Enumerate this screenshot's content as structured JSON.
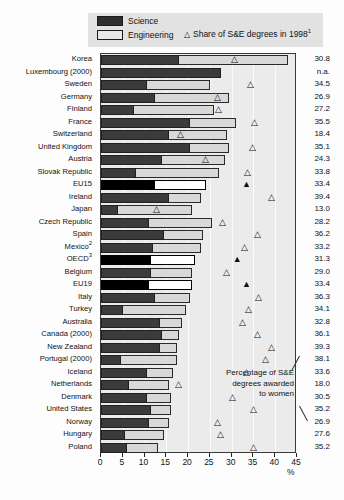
{
  "legend": {
    "science_label": "Science",
    "engineering_label": "Engineering",
    "triangle_glyph": "△",
    "share_label": "Share of S&E degrees in 1998",
    "share_footnote": "1"
  },
  "annotation": {
    "line1": "Percentage of S&E",
    "line2": "degrees awarded",
    "line3": "to women"
  },
  "axis": {
    "ticks": [
      "0",
      "5",
      "10",
      "15",
      "20",
      "25",
      "30",
      "35",
      "40",
      "45"
    ],
    "unit": "%",
    "min": 0,
    "max": 45
  },
  "colors": {
    "science": "#3b3b3b",
    "engineering": "#d8d8d8",
    "highlight": "#000000",
    "plot_bg": "#ebebeb",
    "legend_bg": "#e2e2e2"
  },
  "chart_data": {
    "type": "bar",
    "orientation": "horizontal",
    "stacked": true,
    "title": "",
    "xlabel": "%",
    "ylabel": "",
    "xlim": [
      0,
      45
    ],
    "grid": true,
    "legend_position": "top",
    "categories": [
      "Korea",
      "Luxembourg (2000)",
      "Sweden",
      "Germany",
      "Finland",
      "France",
      "Switzerland",
      "United Kingdom",
      "Austria",
      "Slovak Republic",
      "EU15",
      "Ireland",
      "Japan",
      "Czech Republic",
      "Spain",
      "Mexico",
      "OECD",
      "Belgium",
      "EU19",
      "Italy",
      "Turkey",
      "Australia",
      "Canada (2000)",
      "New Zealand",
      "Portugal (2000)",
      "Iceland",
      "Netherlands",
      "Denmark",
      "United States",
      "Norway",
      "Hungary",
      "Poland"
    ],
    "category_footnotes": {
      "Mexico": "2",
      "OECD": "3"
    },
    "series": [
      {
        "name": "Science",
        "values": [
          18.0,
          27.5,
          10.5,
          12.5,
          7.5,
          20.5,
          15.5,
          20.5,
          14.0,
          8.0,
          12.5,
          15.5,
          4.0,
          11.0,
          14.5,
          12.0,
          11.5,
          11.5,
          11.0,
          12.5,
          5.0,
          13.5,
          14.0,
          13.5,
          4.5,
          10.5,
          6.5,
          10.5,
          11.5,
          11.0,
          5.5,
          6.0
        ]
      },
      {
        "name": "Engineering",
        "values": [
          25.0,
          0.0,
          14.5,
          17.0,
          18.5,
          10.5,
          13.5,
          9.0,
          14.5,
          19.0,
          11.5,
          7.5,
          17.0,
          14.5,
          9.0,
          11.0,
          10.0,
          9.5,
          10.0,
          8.0,
          14.5,
          5.0,
          4.0,
          4.0,
          13.0,
          6.0,
          9.0,
          5.5,
          4.5,
          4.5,
          9.0,
          7.0
        ]
      }
    ],
    "totals": [
      43.0,
      27.5,
      25.0,
      29.5,
      26.0,
      31.0,
      29.0,
      29.5,
      28.5,
      27.0,
      24.0,
      23.0,
      21.0,
      25.5,
      23.5,
      23.0,
      21.5,
      21.0,
      21.0,
      20.5,
      19.5,
      18.5,
      18.0,
      17.5,
      17.5,
      16.5,
      15.5,
      16.0,
      16.0,
      15.5,
      14.5,
      13.0
    ],
    "share_of_se_degrees_1998": [
      {
        "category": "Korea",
        "value": 30.8,
        "marker": "open"
      },
      {
        "category": "Luxembourg (2000)",
        "value": null,
        "label": "n.a.",
        "marker": "none"
      },
      {
        "category": "Sweden",
        "value": 34.5,
        "marker": "open"
      },
      {
        "category": "Germany",
        "value": 26.9,
        "marker": "open"
      },
      {
        "category": "Finland",
        "value": 27.2,
        "marker": "open"
      },
      {
        "category": "France",
        "value": 35.5,
        "marker": "open"
      },
      {
        "category": "Switzerland",
        "value": 18.4,
        "marker": "open"
      },
      {
        "category": "United Kingdom",
        "value": 35.1,
        "marker": "open"
      },
      {
        "category": "Austria",
        "value": 24.3,
        "marker": "open"
      },
      {
        "category": "Slovak Republic",
        "value": 33.8,
        "marker": "open"
      },
      {
        "category": "EU15",
        "value": 33.4,
        "marker": "filled"
      },
      {
        "category": "Ireland",
        "value": 39.4,
        "marker": "open"
      },
      {
        "category": "Japan",
        "value": 13.0,
        "marker": "open"
      },
      {
        "category": "Czech Republic",
        "value": 28.2,
        "marker": "open"
      },
      {
        "category": "Spain",
        "value": 36.2,
        "marker": "open"
      },
      {
        "category": "Mexico",
        "value": 33.2,
        "marker": "open"
      },
      {
        "category": "OECD",
        "value": 31.3,
        "marker": "filled"
      },
      {
        "category": "Belgium",
        "value": 29.0,
        "marker": "open"
      },
      {
        "category": "EU19",
        "value": 33.4,
        "marker": "filled"
      },
      {
        "category": "Italy",
        "value": 36.3,
        "marker": "open"
      },
      {
        "category": "Turkey",
        "value": 34.1,
        "marker": "open"
      },
      {
        "category": "Australia",
        "value": 32.8,
        "marker": "open"
      },
      {
        "category": "Canada (2000)",
        "value": 36.1,
        "marker": "open"
      },
      {
        "category": "New Zealand",
        "value": 39.3,
        "marker": "open"
      },
      {
        "category": "Portugal (2000)",
        "value": 38.1,
        "marker": "open"
      },
      {
        "category": "Iceland",
        "value": 33.6,
        "marker": "open"
      },
      {
        "category": "Netherlands",
        "value": 18.0,
        "marker": "open"
      },
      {
        "category": "Denmark",
        "value": 30.5,
        "marker": "open"
      },
      {
        "category": "United States",
        "value": 35.2,
        "marker": "open"
      },
      {
        "category": "Norway",
        "value": 26.9,
        "marker": "open"
      },
      {
        "category": "Hungary",
        "value": 27.6,
        "marker": "open"
      },
      {
        "category": "Poland",
        "value": 35.2,
        "marker": "open"
      }
    ],
    "value_labels": [
      "30.8",
      "n.a.",
      "34.5",
      "26.9",
      "27.2",
      "35.5",
      "18.4",
      "35.1",
      "24.3",
      "33.8",
      "33.4",
      "39.4",
      "13.0",
      "28.2",
      "36.2",
      "33.2",
      "31.3",
      "29.0",
      "33.4",
      "36.3",
      "34.1",
      "32.8",
      "36.1",
      "39.3",
      "38.1",
      "33.6",
      "18.0",
      "30.5",
      "35.2",
      "26.9",
      "27.6",
      "35.2"
    ],
    "highlighted_rows": [
      "EU15",
      "OECD",
      "EU19"
    ]
  }
}
